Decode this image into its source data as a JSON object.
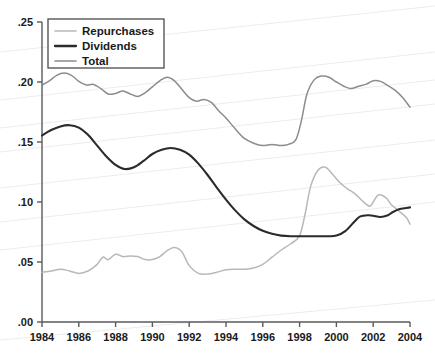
{
  "chart_data": {
    "type": "line",
    "title": "",
    "subtitle": "",
    "xlabel": "",
    "ylabel": "",
    "xlim": [
      1984,
      2004
    ],
    "ylim": [
      0.0,
      0.25
    ],
    "grid": false,
    "legend_position": "top-left",
    "x_tick_labels": [
      "1984",
      "1986",
      "1988",
      "1990",
      "1992",
      "1994",
      "1996",
      "1998",
      "2000",
      "2002",
      "2004"
    ],
    "x_ticks": [
      1984,
      1986,
      1988,
      1990,
      1992,
      1994,
      1996,
      1998,
      2000,
      2002,
      2004
    ],
    "y_tick_labels": [
      ".00",
      ".05",
      ".10",
      ".15",
      ".20",
      ".25"
    ],
    "y_ticks": [
      0.0,
      0.05,
      0.1,
      0.15,
      0.2,
      0.25
    ],
    "series": [
      {
        "name": "Repurchases",
        "color": "#b8b8b8",
        "x": [
          1984,
          1984.5,
          1985,
          1985.5,
          1986,
          1986.5,
          1987,
          1987.3,
          1987.6,
          1988,
          1988.4,
          1988.8,
          1989.2,
          1989.6,
          1990,
          1990.4,
          1990.8,
          1991.2,
          1991.6,
          1992,
          1992.5,
          1993,
          1993.5,
          1994,
          1994.5,
          1995,
          1995.5,
          1996,
          1996.5,
          1997,
          1997.5,
          1998,
          1998.3,
          1998.6,
          1999,
          1999.4,
          1999.8,
          2000.2,
          2000.6,
          2001,
          2001.4,
          2001.8,
          2002,
          2002.3,
          2002.7,
          2003,
          2003.4,
          2003.8,
          2004
        ],
        "values": [
          0.0415,
          0.0425,
          0.044,
          0.0425,
          0.0405,
          0.0425,
          0.048,
          0.054,
          0.052,
          0.0565,
          0.0545,
          0.055,
          0.0545,
          0.052,
          0.052,
          0.0545,
          0.0595,
          0.062,
          0.0585,
          0.047,
          0.0405,
          0.04,
          0.0415,
          0.0435,
          0.044,
          0.044,
          0.045,
          0.048,
          0.054,
          0.06,
          0.065,
          0.072,
          0.09,
          0.113,
          0.1265,
          0.129,
          0.123,
          0.116,
          0.111,
          0.107,
          0.101,
          0.0965,
          0.1,
          0.106,
          0.1035,
          0.0975,
          0.0925,
          0.087,
          0.0815
        ]
      },
      {
        "name": "Dividends",
        "color": "#2b2b2b",
        "x": [
          1984,
          1984.5,
          1985,
          1985.5,
          1986,
          1986.5,
          1987,
          1987.5,
          1988,
          1988.5,
          1989,
          1989.5,
          1990,
          1990.5,
          1991,
          1991.5,
          1992,
          1992.5,
          1993,
          1993.5,
          1994,
          1994.5,
          1995,
          1995.5,
          1996,
          1996.5,
          1997,
          1997.5,
          1998,
          1998.5,
          1999,
          1999.5,
          2000,
          2000.5,
          2001,
          2001.3,
          2001.7,
          2002,
          2002.4,
          2002.8,
          2003,
          2003.4,
          2003.8,
          2004
        ],
        "values": [
          0.1555,
          0.16,
          0.163,
          0.164,
          0.162,
          0.156,
          0.147,
          0.138,
          0.131,
          0.1275,
          0.129,
          0.134,
          0.14,
          0.1435,
          0.145,
          0.1435,
          0.1395,
          0.132,
          0.1225,
          0.112,
          0.102,
          0.093,
          0.0855,
          0.08,
          0.076,
          0.0735,
          0.072,
          0.0715,
          0.0715,
          0.0715,
          0.0715,
          0.0715,
          0.072,
          0.076,
          0.084,
          0.088,
          0.089,
          0.0885,
          0.0875,
          0.089,
          0.091,
          0.094,
          0.095,
          0.0955
        ]
      },
      {
        "name": "Total",
        "color": "#8c8c8c",
        "x": [
          1984,
          1984.4,
          1984.8,
          1985.2,
          1985.6,
          1986,
          1986.4,
          1986.8,
          1987.2,
          1987.6,
          1988,
          1988.4,
          1988.8,
          1989.2,
          1989.6,
          1990,
          1990.4,
          1990.8,
          1991.2,
          1991.6,
          1992,
          1992.4,
          1992.8,
          1993.2,
          1993.6,
          1994,
          1994.5,
          1995,
          1995.5,
          1996,
          1996.5,
          1997,
          1997.4,
          1997.8,
          1998.1,
          1998.4,
          1998.8,
          1999.2,
          1999.6,
          2000,
          2000.4,
          2000.8,
          2001.2,
          2001.6,
          2002,
          2002.4,
          2002.8,
          2003.2,
          2003.6,
          2004
        ],
        "values": [
          0.1975,
          0.201,
          0.2055,
          0.2075,
          0.2055,
          0.2005,
          0.1975,
          0.198,
          0.1945,
          0.19,
          0.1905,
          0.1925,
          0.19,
          0.188,
          0.191,
          0.196,
          0.201,
          0.204,
          0.201,
          0.194,
          0.187,
          0.184,
          0.1855,
          0.183,
          0.176,
          0.17,
          0.161,
          0.153,
          0.149,
          0.147,
          0.148,
          0.147,
          0.148,
          0.152,
          0.168,
          0.19,
          0.202,
          0.205,
          0.204,
          0.2,
          0.1965,
          0.1945,
          0.1965,
          0.198,
          0.201,
          0.2005,
          0.197,
          0.193,
          0.187,
          0.179
        ]
      }
    ]
  },
  "legend": {
    "items": [
      {
        "label": "Repurchases",
        "color": "#b8b8b8"
      },
      {
        "label": "Dividends",
        "color": "#2b2b2b"
      },
      {
        "label": "Total",
        "color": "#8c8c8c"
      }
    ]
  },
  "axes": {
    "axis_color": "#5a5a5a",
    "label_color": "#1a1a1a"
  },
  "background": {
    "color": "#ffffff",
    "artifact_color": "#ececec"
  }
}
